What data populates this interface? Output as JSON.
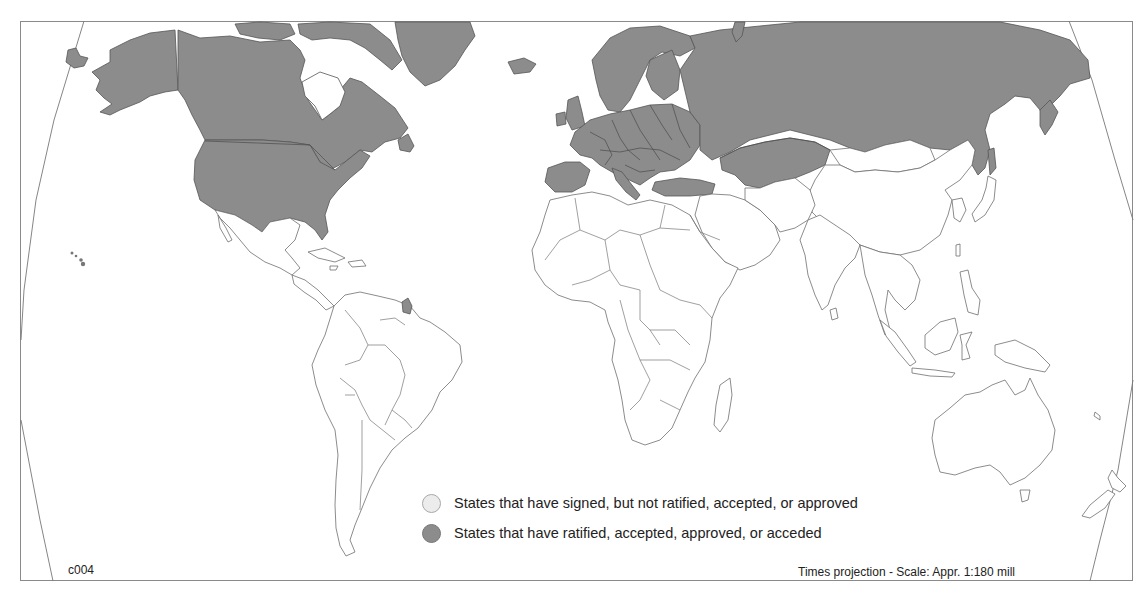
{
  "map": {
    "code": "c004",
    "projection_note": "Times projection - Scale: Appr. 1:180 mill",
    "colors": {
      "ratified_fill": "#8c8c8c",
      "signed_fill": "#ececec",
      "non_party_fill": "#ffffff",
      "frame": "#8a8a8a"
    },
    "regions_shaded_ratified": [
      "North America (USA, Canada)",
      "Greenland",
      "Europe",
      "Russia",
      "Kazakhstan",
      "Kyrgyzstan",
      "Turkey",
      "French Guiana"
    ]
  },
  "legend": {
    "items": [
      {
        "key": "signed",
        "label": "States that have signed, but not ratified, accepted, or approved",
        "color": "#ececec"
      },
      {
        "key": "ratified",
        "label": "States that have ratified, accepted, approved, or acceded",
        "color": "#8c8c8c"
      }
    ]
  }
}
